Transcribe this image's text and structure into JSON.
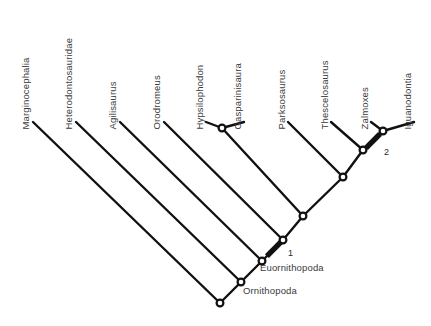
{
  "figure": {
    "background_color": "#ffffff",
    "line_color": "#111111",
    "text_color": "#3a3a3a",
    "node_fill": "#ffffff"
  },
  "tips": [
    {
      "id": "marginocephalia",
      "label": "Marginocephalia",
      "x": 30,
      "y": 120
    },
    {
      "id": "heterodontosauridae",
      "label": "Heterodontosauridae",
      "x": 73,
      "y": 120
    },
    {
      "id": "agilisaurus",
      "label": "Agilisaurus",
      "x": 117,
      "y": 120
    },
    {
      "id": "orodromeus",
      "label": "Orodromeus",
      "x": 161,
      "y": 120
    },
    {
      "id": "hypsilophodon",
      "label": "Hypsilophodon",
      "x": 204,
      "y": 120
    },
    {
      "id": "gasparinisaura",
      "label": "Gasparinisaura",
      "x": 242,
      "y": 120
    },
    {
      "id": "parksosaurus",
      "label": "Parksosaurus",
      "x": 286,
      "y": 120
    },
    {
      "id": "thescelosaurus",
      "label": "Thescelosaurus",
      "x": 329,
      "y": 120
    },
    {
      "id": "zalmoxes",
      "label": "Zalmoxes",
      "x": 369,
      "y": 120
    },
    {
      "id": "iguanodontia",
      "label": "Iguanodontia",
      "x": 412,
      "y": 120
    }
  ],
  "nodes": [
    {
      "id": "node-root",
      "x": 220,
      "y": 303
    },
    {
      "id": "node-ornithopoda",
      "x": 241,
      "y": 282
    },
    {
      "id": "node-euornithopoda",
      "x": 262,
      "y": 261
    },
    {
      "id": "node-clade-a",
      "x": 283,
      "y": 240
    },
    {
      "id": "node-clade-b",
      "x": 303,
      "y": 216
    },
    {
      "id": "node-clade-c",
      "x": 343,
      "y": 177
    },
    {
      "id": "node-clade-d",
      "x": 363,
      "y": 150
    },
    {
      "id": "node-clade-e",
      "x": 383,
      "y": 131
    },
    {
      "id": "node-hypsi-gaspa",
      "x": 222,
      "y": 128
    }
  ],
  "branches": [
    {
      "id": "branch-marginocephalia",
      "x1": 220,
      "y1": 303,
      "x2": 33,
      "y2": 122
    },
    {
      "id": "branch-root-ornithopoda",
      "x1": 220,
      "y1": 303,
      "x2": 241,
      "y2": 282
    },
    {
      "id": "branch-heterodontosauridae",
      "x1": 241,
      "y1": 282,
      "x2": 76,
      "y2": 122
    },
    {
      "id": "branch-orn-euorn",
      "x1": 241,
      "y1": 282,
      "x2": 262,
      "y2": 261
    },
    {
      "id": "branch-agilisaurus",
      "x1": 262,
      "y1": 261,
      "x2": 120,
      "y2": 122
    },
    {
      "id": "branch-euorn-cladea",
      "x1": 262,
      "y1": 261,
      "x2": 283,
      "y2": 240
    },
    {
      "id": "branch-orodromeus",
      "x1": 283,
      "y1": 240,
      "x2": 164,
      "y2": 122
    },
    {
      "id": "branch-cladea-cladeb",
      "x1": 283,
      "y1": 240,
      "x2": 303,
      "y2": 216
    },
    {
      "id": "branch-to-hypsi-gaspa",
      "x1": 303,
      "y1": 216,
      "x2": 222,
      "y2": 128
    },
    {
      "id": "branch-hypsilophodon",
      "x1": 222,
      "y1": 128,
      "x2": 206,
      "y2": 122
    },
    {
      "id": "branch-gasparinisaura",
      "x1": 222,
      "y1": 128,
      "x2": 244,
      "y2": 122
    },
    {
      "id": "branch-cladeb-cladec",
      "x1": 303,
      "y1": 216,
      "x2": 343,
      "y2": 177
    },
    {
      "id": "branch-parksosaurus",
      "x1": 343,
      "y1": 177,
      "x2": 288,
      "y2": 122
    },
    {
      "id": "branch-cladec-claded",
      "x1": 343,
      "y1": 177,
      "x2": 363,
      "y2": 150
    },
    {
      "id": "branch-thescelosaurus",
      "x1": 363,
      "y1": 150,
      "x2": 331,
      "y2": 122
    },
    {
      "id": "branch-claded-cladee",
      "x1": 363,
      "y1": 150,
      "x2": 383,
      "y2": 131
    },
    {
      "id": "branch-zalmoxes",
      "x1": 383,
      "y1": 131,
      "x2": 371,
      "y2": 122
    },
    {
      "id": "branch-iguanodontia",
      "x1": 383,
      "y1": 131,
      "x2": 414,
      "y2": 122
    }
  ],
  "character_marks": [
    {
      "id": "mark-1",
      "label": "1",
      "cx": 274,
      "cy": 249,
      "label_x": 288,
      "label_y": 249
    },
    {
      "id": "mark-2",
      "label": "2",
      "cx": 373,
      "cy": 141,
      "label_x": 384,
      "label_y": 148
    }
  ],
  "clade_labels": [
    {
      "id": "clade-euornithopoda",
      "label": "Euornithopoda",
      "x": 260,
      "y": 263
    },
    {
      "id": "clade-ornithopoda",
      "label": "Ornithopoda",
      "x": 243,
      "y": 286
    }
  ]
}
